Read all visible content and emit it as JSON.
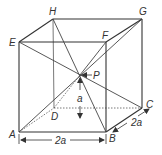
{
  "figure": {
    "vertices": {
      "A": {
        "label": "A",
        "x": 19,
        "y": 132
      },
      "B": {
        "label": "B",
        "x": 106,
        "y": 132
      },
      "C": {
        "label": "C",
        "x": 142,
        "y": 108
      },
      "D": {
        "label": "D",
        "x": 54,
        "y": 108
      },
      "E": {
        "label": "E",
        "x": 19,
        "y": 42
      },
      "F": {
        "label": "F",
        "x": 106,
        "y": 42
      },
      "G": {
        "label": "G",
        "x": 142,
        "y": 19
      },
      "H": {
        "label": "H",
        "x": 53,
        "y": 19
      }
    },
    "center_point": {
      "label": "P",
      "x": 80,
      "y": 75
    },
    "dimensions": {
      "width_label": "2a",
      "depth_label": "2a",
      "height_label": "a"
    }
  }
}
